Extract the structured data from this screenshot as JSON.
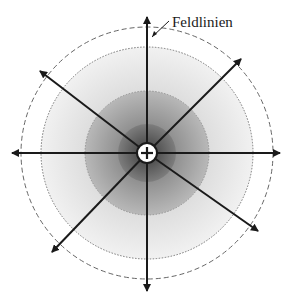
{
  "diagram": {
    "top_text_cropped": "...ng g... ...p...",
    "label": "Feldlinien",
    "center_symbol": "+",
    "center": [
      147,
      153
    ],
    "circles": {
      "outer_dashed_r": 126,
      "dotted_r": 106,
      "mid_shaded_r": 62,
      "inner_dark_r": 29,
      "charge_r": 10
    },
    "colors": {
      "line": "#1a1a1a",
      "dashed": "#666666",
      "dotted": "#777777",
      "zone_light": "#e9e9e9",
      "zone_mid": "#a6a6a6",
      "zone_dark": "#6e6e6e",
      "charge_fill": "#ffffff"
    },
    "field_lines": [
      {
        "name": "up",
        "tip": [
          147,
          15
        ]
      },
      {
        "name": "down",
        "tip": [
          147,
          293
        ]
      },
      {
        "name": "left",
        "tip": [
          10,
          153
        ]
      },
      {
        "name": "right",
        "tip": [
          282,
          153
        ]
      },
      {
        "name": "up-right",
        "tip": [
          243,
          57
        ]
      },
      {
        "name": "up-left",
        "tip": [
          38,
          70
        ]
      },
      {
        "name": "down-right",
        "tip": [
          260,
          232
        ]
      },
      {
        "name": "down-left",
        "tip": [
          50,
          254
        ]
      }
    ]
  }
}
